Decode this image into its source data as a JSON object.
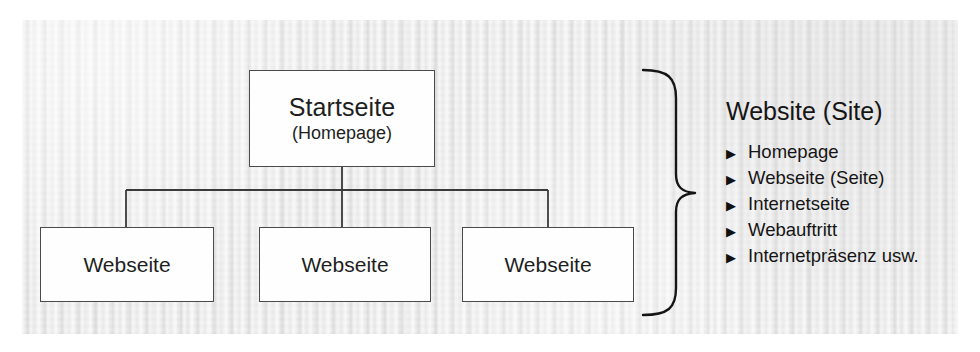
{
  "diagram": {
    "root": {
      "title": "Startseite",
      "subtitle": "(Homepage)"
    },
    "children": [
      {
        "label": "Webseite"
      },
      {
        "label": "Webseite"
      },
      {
        "label": "Webseite"
      }
    ],
    "brace": {
      "symbol": "right-curly-brace"
    },
    "legend": {
      "title": "Website (Site)",
      "bullet_glyph": "▶",
      "items": [
        {
          "label": "Homepage"
        },
        {
          "label": "Webseite (Seite)"
        },
        {
          "label": "Internetseite"
        },
        {
          "label": "Webauftritt"
        },
        {
          "label": "Internetpräsenz usw."
        }
      ]
    },
    "colors": {
      "paper": "#e9e9e9",
      "box_fill": "#fefefe",
      "box_border": "#4a4a4a",
      "text": "#151515",
      "connector": "#3a3a3a",
      "brace": "#151515"
    }
  }
}
